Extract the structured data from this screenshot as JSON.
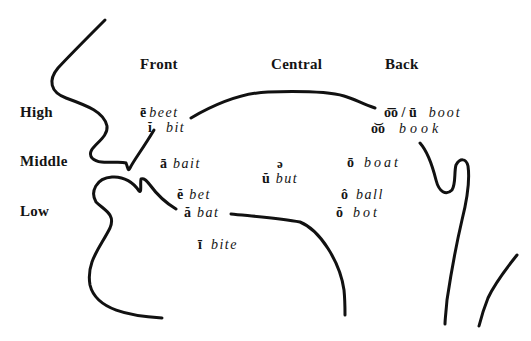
{
  "diagram": {
    "columns": [
      {
        "label": "Front"
      },
      {
        "label": "Central"
      },
      {
        "label": "Back"
      }
    ],
    "rows": [
      {
        "label": "High"
      },
      {
        "label": "Middle"
      },
      {
        "label": "Low"
      }
    ],
    "vowels": [
      {
        "symbol": "ē",
        "word": "beet",
        "position": "high-front"
      },
      {
        "symbol": "ĭ",
        "word": "bit",
        "position": "high-front"
      },
      {
        "symbol": "ā",
        "word": "bait",
        "position": "middle-front"
      },
      {
        "symbol": "ə",
        "word": "",
        "position": "middle-central"
      },
      {
        "symbol": "ŭ",
        "word": "but",
        "position": "middle-central"
      },
      {
        "symbol": "ō",
        "word": "boat",
        "position": "middle-back"
      },
      {
        "symbol": "ĕ",
        "word": "bet",
        "position": "low-front"
      },
      {
        "symbol": "ă",
        "word": "bat",
        "position": "low-front"
      },
      {
        "symbol": "ī",
        "word": "bite",
        "position": "low-front"
      },
      {
        "symbol": "ô",
        "word": "ball",
        "position": "low-back"
      },
      {
        "symbol": "ŏ",
        "word": "bot",
        "position": "low-back"
      },
      {
        "symbol": "o͞o / ū",
        "word": "boot",
        "position": "high-back"
      },
      {
        "symbol": "o͝o",
        "word": "book",
        "position": "high-back"
      }
    ],
    "line_color": "#111111"
  }
}
